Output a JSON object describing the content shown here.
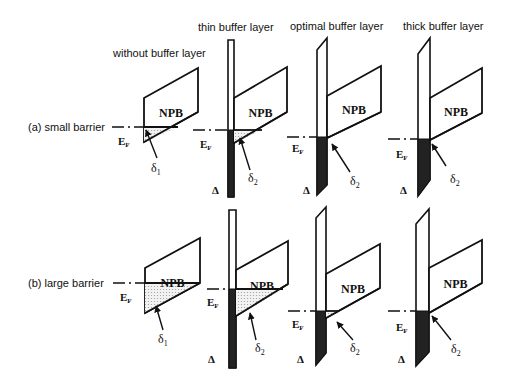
{
  "column_headers": [
    {
      "label": "without buffer layer",
      "x": 113,
      "y": 57
    },
    {
      "label": "thin buffer layer",
      "x": 198,
      "y": 31
    },
    {
      "label": "optimal buffer layer",
      "x": 290,
      "y": 30
    },
    {
      "label": "thick buffer layer",
      "x": 403,
      "y": 30
    }
  ],
  "row_labels": [
    {
      "label": "(a) small barrier",
      "x": 28,
      "y": 131
    },
    {
      "label": "(b) large barrier",
      "x": 28,
      "y": 287
    }
  ],
  "symbols": {
    "npb": "NPB",
    "ef_main": "E",
    "ef_sub": "F",
    "delta_cap": "Δ",
    "delta_small": "δ",
    "delta_1_sub": "1",
    "delta_2_sub": "2"
  },
  "panels": [
    {
      "id": "a-without",
      "row": "a",
      "column": "without buffer layer",
      "npb": [
        [
          144,
          98
        ],
        [
          198,
          68
        ],
        [
          198,
          112
        ],
        [
          144,
          142
        ]
      ],
      "ef_y": 127,
      "ef_x1": 112,
      "ef_x2": 144,
      "shade": [
        [
          144,
          127
        ],
        [
          178,
          127
        ],
        [
          144,
          142
        ]
      ],
      "bar": null,
      "ef_label": [
        118,
        145
      ],
      "delta_label": [
        151,
        172
      ],
      "delta_sub": "1",
      "arrow": [
        [
          157,
          158
        ],
        [
          146,
          130
        ]
      ],
      "big_delta": null
    },
    {
      "id": "a-thin",
      "row": "a",
      "column": "thin buffer layer",
      "npb": [
        [
          234,
          98
        ],
        [
          287,
          67
        ],
        [
          287,
          112
        ],
        [
          234,
          143
        ]
      ],
      "ef_y": 130,
      "ef_x1": 193,
      "ef_x2": 228,
      "shade": [
        [
          234,
          130
        ],
        [
          262,
          130
        ],
        [
          234,
          143
        ]
      ],
      "bar": {
        "outline": [
          [
            228,
            40
          ],
          [
            234,
            40
          ],
          [
            234,
            197
          ],
          [
            228,
            197
          ]
        ],
        "dark": [
          [
            228,
            130
          ],
          [
            234,
            130
          ],
          [
            234,
            197
          ],
          [
            228,
            197
          ]
        ]
      },
      "ef_label": [
        200,
        148
      ],
      "delta_label": [
        248,
        182
      ],
      "delta_sub": "2",
      "arrow": [
        [
          250,
          170
        ],
        [
          240,
          138
        ]
      ],
      "big_delta": [
        212,
        194
      ]
    },
    {
      "id": "a-optimal",
      "row": "a",
      "column": "optimal buffer layer",
      "npb": [
        [
          327,
          96
        ],
        [
          381,
          66
        ],
        [
          381,
          112
        ],
        [
          327,
          138
        ]
      ],
      "ef_y": 137,
      "ef_x1": 287,
      "ef_x2": 317,
      "shade": [
        [
          327,
          137
        ],
        [
          330,
          137
        ],
        [
          327,
          138
        ]
      ],
      "bar": {
        "outline": [
          [
            317,
            50
          ],
          [
            327,
            38
          ],
          [
            327,
            185
          ],
          [
            317,
            195
          ]
        ],
        "dark": [
          [
            317,
            137
          ],
          [
            327,
            137
          ],
          [
            327,
            185
          ],
          [
            317,
            195
          ]
        ]
      },
      "ef_label": [
        292,
        152
      ],
      "delta_label": [
        350,
        185
      ],
      "delta_sub": "2",
      "arrow": [
        [
          350,
          172
        ],
        [
          332,
          144
        ]
      ],
      "big_delta": [
        303,
        194
      ]
    },
    {
      "id": "a-thick",
      "row": "a",
      "column": "thick buffer layer",
      "npb": [
        [
          430,
          98
        ],
        [
          482,
          68
        ],
        [
          482,
          113
        ],
        [
          430,
          140
        ]
      ],
      "ef_y": 139,
      "ef_x1": 388,
      "ef_x2": 418,
      "shade": null,
      "bar": {
        "outline": [
          [
            418,
            54
          ],
          [
            430,
            38
          ],
          [
            430,
            180
          ],
          [
            418,
            196
          ]
        ],
        "dark": [
          [
            418,
            139
          ],
          [
            430,
            139
          ],
          [
            430,
            180
          ],
          [
            418,
            196
          ]
        ]
      },
      "ef_label": [
        396,
        158
      ],
      "delta_label": [
        450,
        183
      ],
      "delta_sub": "2",
      "arrow": [
        [
          446,
          166
        ],
        [
          432,
          144
        ]
      ],
      "big_delta": [
        400,
        194
      ]
    },
    {
      "id": "b-without",
      "row": "b",
      "column": "without buffer layer",
      "npb": [
        [
          145,
          268
        ],
        [
          200,
          238
        ],
        [
          200,
          283
        ],
        [
          145,
          313
        ]
      ],
      "ef_y": 283,
      "ef_x1": 113,
      "ef_x2": 145,
      "shade": [
        [
          145,
          283
        ],
        [
          200,
          283
        ],
        [
          145,
          313
        ]
      ],
      "bar": null,
      "ef_label": [
        120,
        301
      ],
      "delta_label": [
        158,
        343
      ],
      "delta_sub": "1",
      "arrow": [
        [
          163,
          330
        ],
        [
          156,
          306
        ]
      ],
      "big_delta": null
    },
    {
      "id": "b-thin",
      "row": "b",
      "column": "thin buffer layer",
      "npb": [
        [
          236,
          270
        ],
        [
          288,
          241
        ],
        [
          288,
          284
        ],
        [
          236,
          316
        ]
      ],
      "ef_y": 289,
      "ef_x1": 207,
      "ef_x2": 229,
      "shade": [
        [
          236,
          289
        ],
        [
          283,
          289
        ],
        [
          236,
          316
        ]
      ],
      "bar": {
        "outline": [
          [
            229,
            210
          ],
          [
            236,
            210
          ],
          [
            236,
            368
          ],
          [
            229,
            368
          ]
        ],
        "dark": [
          [
            229,
            289
          ],
          [
            236,
            289
          ],
          [
            236,
            368
          ],
          [
            229,
            368
          ]
        ]
      },
      "ef_label": [
        207,
        306
      ],
      "delta_label": [
        255,
        352
      ],
      "delta_sub": "2",
      "arrow": [
        [
          256,
          340
        ],
        [
          250,
          313
        ]
      ],
      "big_delta": [
        208,
        363
      ]
    },
    {
      "id": "b-optimal",
      "row": "b",
      "column": "optimal buffer layer",
      "npb": [
        [
          326,
          274
        ],
        [
          380,
          244
        ],
        [
          380,
          288
        ],
        [
          326,
          318
        ]
      ],
      "ef_y": 311,
      "ef_x1": 288,
      "ef_x2": 316,
      "shade": [
        [
          326,
          311
        ],
        [
          338,
          311
        ],
        [
          326,
          318
        ]
      ],
      "bar": {
        "outline": [
          [
            316,
            218
          ],
          [
            326,
            207
          ],
          [
            326,
            353
          ],
          [
            316,
            365
          ]
        ],
        "dark": [
          [
            316,
            311
          ],
          [
            326,
            311
          ],
          [
            326,
            353
          ],
          [
            316,
            365
          ]
        ]
      },
      "ef_label": [
        292,
        328
      ],
      "delta_label": [
        350,
        352
      ],
      "delta_sub": "2",
      "arrow": [
        [
          353,
          340
        ],
        [
          337,
          322
        ]
      ],
      "big_delta": [
        297,
        363
      ]
    },
    {
      "id": "b-thick",
      "row": "b",
      "column": "thick buffer layer",
      "npb": [
        [
          429,
          268
        ],
        [
          482,
          240
        ],
        [
          482,
          283
        ],
        [
          429,
          313
        ]
      ],
      "ef_y": 311,
      "ef_x1": 388,
      "ef_x2": 416,
      "shade": null,
      "bar": {
        "outline": [
          [
            416,
            224
          ],
          [
            429,
            209
          ],
          [
            429,
            352
          ],
          [
            416,
            366
          ]
        ],
        "dark": [
          [
            416,
            311
          ],
          [
            429,
            311
          ],
          [
            429,
            352
          ],
          [
            416,
            366
          ]
        ]
      },
      "ef_label": [
        396,
        331
      ],
      "delta_label": [
        451,
        353
      ],
      "delta_sub": "2",
      "arrow": [
        [
          451,
          340
        ],
        [
          432,
          316
        ]
      ],
      "big_delta": [
        398,
        363
      ]
    }
  ],
  "colors": {
    "line": "#111111",
    "dark_fill": "#222222",
    "background": "#ffffff",
    "dot_fill": "#9a9a9a"
  }
}
